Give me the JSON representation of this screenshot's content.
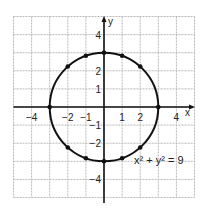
{
  "chart_data": {
    "type": "scatter",
    "title": "",
    "equation_label": "x² + y² = 9",
    "xlabel": "x",
    "ylabel": "y",
    "xlim": [
      -5,
      5
    ],
    "ylim": [
      -5,
      5
    ],
    "grid": true,
    "x_tick_labels": [
      {
        "value": -4,
        "label": "−4"
      },
      {
        "value": -2,
        "label": "−2"
      },
      {
        "value": -1,
        "label": "−1"
      },
      {
        "value": 1,
        "label": "1"
      },
      {
        "value": 2,
        "label": "2"
      },
      {
        "value": 4,
        "label": "4"
      }
    ],
    "y_tick_labels": [
      {
        "value": 4,
        "label": "4"
      },
      {
        "value": 2,
        "label": "2"
      },
      {
        "value": 1,
        "label": "1"
      },
      {
        "value": -1,
        "label": "−1"
      },
      {
        "value": -2,
        "label": "−2"
      },
      {
        "value": -4,
        "label": "−4"
      }
    ],
    "curve": {
      "shape": "circle",
      "center": [
        0,
        0
      ],
      "radius": 3
    },
    "points": [
      {
        "x": 3,
        "y": 0
      },
      {
        "x": -3,
        "y": 0
      },
      {
        "x": 0,
        "y": 3
      },
      {
        "x": 0,
        "y": -3
      },
      {
        "x": 1,
        "y": 2.83
      },
      {
        "x": -1,
        "y": 2.83
      },
      {
        "x": 1,
        "y": -2.83
      },
      {
        "x": -1,
        "y": -2.83
      },
      {
        "x": 2,
        "y": 2.24
      },
      {
        "x": -2,
        "y": 2.24
      },
      {
        "x": 2,
        "y": -2.24
      },
      {
        "x": -2,
        "y": -2.24
      }
    ],
    "colors": {
      "grid": "#b8b8b8",
      "axis": "#111111",
      "curve": "#111111",
      "point": "#111111"
    }
  }
}
